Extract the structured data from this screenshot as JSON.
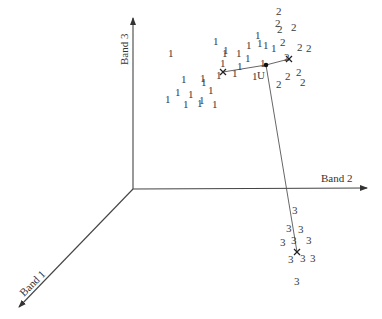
{
  "diagram": {
    "title": "",
    "axes": {
      "band1": {
        "label": "Band 1"
      },
      "band2": {
        "label": "Band 2"
      },
      "band3": {
        "label": "Band 3"
      }
    },
    "unknown_label": "U",
    "classes": [
      {
        "name": "1",
        "points": [
          [
            168,
            57
          ],
          [
            213,
            45
          ],
          [
            223,
            54
          ],
          [
            236,
            57
          ],
          [
            246,
            49
          ],
          [
            257,
            47
          ],
          [
            271,
            52
          ],
          [
            255,
            39
          ],
          [
            263,
            49
          ],
          [
            181,
            83
          ],
          [
            201,
            86
          ],
          [
            183,
            108
          ],
          [
            188,
            98
          ],
          [
            200,
            82
          ],
          [
            216,
            79
          ],
          [
            220,
            67
          ],
          [
            222,
            57
          ],
          [
            237,
            70
          ],
          [
            252,
            80
          ],
          [
            260,
            67
          ],
          [
            245,
            62
          ],
          [
            232,
            77
          ],
          [
            175,
            96
          ],
          [
            199,
            104
          ],
          [
            208,
            94
          ],
          [
            212,
            108
          ],
          [
            165,
            103
          ],
          [
            197,
            107
          ]
        ]
      },
      {
        "name": "2",
        "points": [
          [
            276,
            15
          ],
          [
            275,
            27
          ],
          [
            277,
            33
          ],
          [
            291,
            31
          ],
          [
            280,
            46
          ],
          [
            297,
            51
          ],
          [
            306,
            52
          ],
          [
            284,
            61
          ],
          [
            276,
            88
          ],
          [
            285,
            80
          ],
          [
            296,
            76
          ],
          [
            300,
            86
          ]
        ]
      },
      {
        "name": "3",
        "points": [
          [
            292,
            214
          ],
          [
            286,
            232
          ],
          [
            298,
            233
          ],
          [
            280,
            246
          ],
          [
            291,
            244
          ],
          [
            306,
            244
          ],
          [
            288,
            263
          ],
          [
            300,
            262
          ],
          [
            310,
            262
          ],
          [
            294,
            285
          ]
        ]
      }
    ],
    "centroids": [
      {
        "class": "1",
        "x": 223,
        "y": 72
      },
      {
        "class": "2",
        "x": 289,
        "y": 59
      },
      {
        "class": "3",
        "x": 297,
        "y": 252
      },
      {
        "class": "U",
        "x": 266,
        "y": 65
      }
    ]
  }
}
